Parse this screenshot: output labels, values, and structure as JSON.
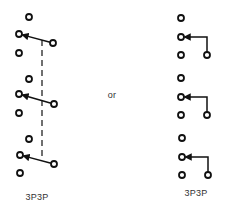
{
  "diagram": {
    "stroke_color": "#111111",
    "text_color": "#333333",
    "separator_label": "or",
    "left": {
      "label": "3P3P",
      "style": "ganged rotary (dashed mechanical link)",
      "poles": [
        {
          "top": [
            29,
            17
          ],
          "left": [
            19,
            34
          ],
          "pivot": [
            53,
            43
          ],
          "bottom": [
            19,
            53
          ]
        },
        {
          "top": [
            29,
            79
          ],
          "left": [
            19,
            94
          ],
          "pivot": [
            54,
            104
          ],
          "bottom": [
            19,
            113
          ]
        },
        {
          "top": [
            29,
            139
          ],
          "left": [
            20,
            155
          ],
          "pivot": [
            54,
            164
          ],
          "bottom": [
            20,
            173
          ]
        }
      ],
      "link": {
        "x": 42,
        "y1": 40,
        "y2": 158
      }
    },
    "right": {
      "label": "3P3P",
      "style": "L-shaped wiper",
      "poles": [
        {
          "top": [
            181,
            18
          ],
          "mid": [
            181,
            37
          ],
          "bottom": [
            181,
            55
          ],
          "common": [
            207,
            55
          ]
        },
        {
          "top": [
            181,
            78
          ],
          "mid": [
            181,
            97
          ],
          "bottom": [
            181,
            115
          ],
          "common": [
            207,
            115
          ]
        },
        {
          "top": [
            182,
            138
          ],
          "mid": [
            182,
            157
          ],
          "bottom": [
            182,
            175
          ],
          "common": [
            208,
            175
          ]
        }
      ]
    },
    "labels": {
      "or": {
        "text": "or",
        "x": 112,
        "y": 95
      },
      "left_caption": {
        "text": "3P3P",
        "x": 37,
        "y": 197
      },
      "right_caption": {
        "text": "3P3P",
        "x": 196,
        "y": 193
      }
    }
  }
}
